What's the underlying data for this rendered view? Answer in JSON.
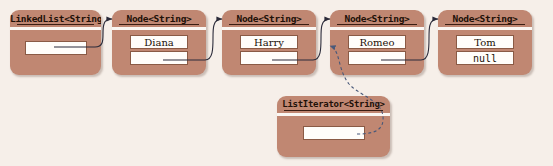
{
  "diagram": {
    "colors": {
      "background": "#f6efe9",
      "box_fill": "#c08772",
      "box_border": "#8a5a45",
      "field_fill": "#fffdfa",
      "solid_link": "#2b2b3a",
      "dashed_link": "#5a6b8c",
      "header_rule": "#3a1d12"
    },
    "list_object": {
      "header": "LinkedList<String>",
      "fields": [
        {
          "kind": "reference",
          "value": ""
        }
      ]
    },
    "nodes": [
      {
        "header": "Node<String>",
        "data_label": "Diana",
        "next_label": "",
        "next_is_null": false
      },
      {
        "header": "Node<String>",
        "data_label": "Harry",
        "next_label": "",
        "next_is_null": false
      },
      {
        "header": "Node<String>",
        "data_label": "Romeo",
        "next_label": "",
        "next_is_null": false
      },
      {
        "header": "Node<String>",
        "data_label": "Tom",
        "next_label": "null",
        "next_is_null": true
      }
    ],
    "iterator_object": {
      "header": "ListIterator<String>",
      "fields": [
        {
          "kind": "reference",
          "value": ""
        }
      ]
    },
    "links": [
      {
        "from": "list-reference-field",
        "to": "node-1-header",
        "style": "solid"
      },
      {
        "from": "node-1-next-field",
        "to": "node-2-header",
        "style": "solid"
      },
      {
        "from": "node-2-next-field",
        "to": "node-3-header",
        "style": "solid"
      },
      {
        "from": "node-3-next-field",
        "to": "node-4-header",
        "style": "solid"
      },
      {
        "from": "iterator-reference-field",
        "to": "node-3-data-field",
        "style": "dashed"
      }
    ]
  }
}
